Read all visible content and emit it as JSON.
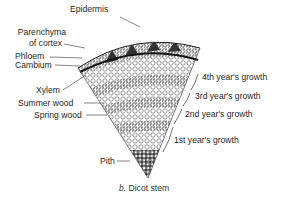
{
  "figure": {
    "caption_letter": "b.",
    "caption_text": "Dicot stem",
    "labels_left": [
      {
        "id": "epidermis",
        "text": "Epidermis"
      },
      {
        "id": "parenchyma-1",
        "text": "Parenchyma"
      },
      {
        "id": "parenchyma-2",
        "text": "of cortex"
      },
      {
        "id": "phloem",
        "text": "Phloem"
      },
      {
        "id": "cambium",
        "text": "Cambium"
      },
      {
        "id": "xylem",
        "text": "Xylem"
      },
      {
        "id": "summer-wood",
        "text": "Summer wood"
      },
      {
        "id": "spring-wood",
        "text": "Spring wood"
      },
      {
        "id": "pith",
        "text": "Pith"
      }
    ],
    "labels_right": [
      {
        "id": "year4",
        "text": "4th year's growth"
      },
      {
        "id": "year3",
        "text": "3rd year's growth"
      },
      {
        "id": "year2",
        "text": "2nd year's growth"
      },
      {
        "id": "year1",
        "text": "1st year's growth"
      }
    ]
  }
}
